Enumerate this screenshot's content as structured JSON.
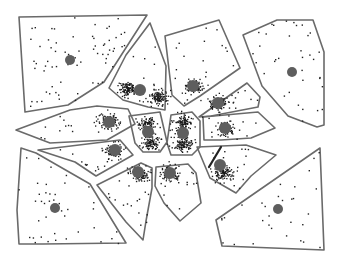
{
  "diagram": {
    "type": "voronoi-cells-with-point-clusters",
    "width": 341,
    "height": 262,
    "colors": {
      "cell_stroke": "#6a6a6a",
      "centroid": "#5e5e5e",
      "points": "#222222",
      "background": "#ffffff"
    },
    "cells": [
      {
        "id": "top-left",
        "points": [
          [
            19,
            17
          ],
          [
            147,
            15
          ],
          [
            104,
            82
          ],
          [
            68,
            105
          ],
          [
            25,
            112
          ]
        ],
        "centroid": [
          70,
          60
        ],
        "centroid_r": 5,
        "scatter": 70,
        "clusters": []
      },
      {
        "id": "top-center-left",
        "points": [
          [
            150,
            23
          ],
          [
            166,
            66
          ],
          [
            165,
            110
          ],
          [
            148,
            107
          ],
          [
            123,
            100
          ],
          [
            109,
            88
          ],
          [
            126,
            55
          ]
        ],
        "centroid": [
          140,
          90
        ],
        "centroid_r": 6,
        "scatter": 14,
        "clusters": [
          [
            127,
            88,
            8,
            110
          ],
          [
            158,
            97,
            8,
            110
          ]
        ]
      },
      {
        "id": "top-center-right",
        "points": [
          [
            165,
            36
          ],
          [
            219,
            20
          ],
          [
            240,
            68
          ],
          [
            200,
            96
          ],
          [
            184,
            106
          ],
          [
            172,
            95
          ]
        ],
        "centroid": [
          193,
          86
        ],
        "centroid_r": 6,
        "scatter": 18,
        "clusters": [
          [
            193,
            86,
            8,
            110
          ]
        ]
      },
      {
        "id": "top-right",
        "points": [
          [
            243,
            35
          ],
          [
            277,
            20
          ],
          [
            313,
            20
          ],
          [
            324,
            52
          ],
          [
            324,
            125
          ],
          [
            317,
            127
          ],
          [
            288,
            116
          ],
          [
            262,
            86
          ]
        ],
        "centroid": [
          292,
          72
        ],
        "centroid_r": 5,
        "scatter": 35,
        "clusters": []
      },
      {
        "id": "mid-right-upper",
        "points": [
          [
            199,
            117
          ],
          [
            247,
            83
          ],
          [
            260,
            97
          ],
          [
            258,
            107
          ],
          [
            211,
            116
          ]
        ],
        "centroid": [
          218,
          103
        ],
        "centroid_r": 6,
        "scatter": 14,
        "clusters": [
          [
            218,
            103,
            8,
            90
          ]
        ]
      },
      {
        "id": "mid-right",
        "points": [
          [
            203,
            117
          ],
          [
            258,
            112
          ],
          [
            275,
            128
          ],
          [
            251,
            138
          ],
          [
            221,
            140
          ],
          [
            204,
            140
          ]
        ],
        "centroid": [
          225,
          128
        ],
        "centroid_r": 6,
        "scatter": 10,
        "clusters": [
          [
            225,
            128,
            8,
            100
          ]
        ]
      },
      {
        "id": "left-upper",
        "points": [
          [
            16,
            130
          ],
          [
            70,
            110
          ],
          [
            97,
            106
          ],
          [
            128,
            109
          ],
          [
            135,
            124
          ],
          [
            107,
            140
          ],
          [
            50,
            143
          ]
        ],
        "centroid": [
          109,
          122
        ],
        "centroid_r": 6,
        "scatter": 14,
        "clusters": [
          [
            108,
            121,
            9,
            110
          ]
        ]
      },
      {
        "id": "center-left-core",
        "points": [
          [
            129,
            116
          ],
          [
            160,
            112
          ],
          [
            167,
            142
          ],
          [
            160,
            152
          ],
          [
            143,
            152
          ],
          [
            135,
            143
          ]
        ],
        "centroid": [
          148,
          132
        ],
        "centroid_r": 6,
        "scatter": 10,
        "clusters": [
          [
            146,
            123,
            7,
            80
          ],
          [
            151,
            142,
            8,
            100
          ]
        ]
      },
      {
        "id": "center-core",
        "points": [
          [
            171,
            115
          ],
          [
            192,
            112
          ],
          [
            200,
            121
          ],
          [
            200,
            147
          ],
          [
            192,
            155
          ],
          [
            171,
            155
          ],
          [
            167,
            143
          ]
        ],
        "centroid": [
          183,
          133
        ],
        "centroid_r": 6,
        "scatter": 16,
        "clusters": [
          [
            183,
            122,
            8,
            100
          ],
          [
            183,
            143,
            8,
            110
          ]
        ]
      },
      {
        "id": "left-lower",
        "points": [
          [
            38,
            150
          ],
          [
            120,
            140
          ],
          [
            133,
            155
          ],
          [
            96,
            176
          ],
          [
            75,
            162
          ]
        ],
        "centroid": [
          115,
          150
        ],
        "centroid_r": 6,
        "scatter": 12,
        "clusters": [
          [
            113,
            150,
            8,
            100
          ]
        ]
      },
      {
        "id": "right-lower-center",
        "points": [
          [
            197,
            147
          ],
          [
            246,
            145
          ],
          [
            276,
            155
          ],
          [
            251,
            176
          ],
          [
            236,
            193
          ],
          [
            210,
            178
          ]
        ],
        "centroid": [
          220,
          165
        ],
        "centroid_r": 6,
        "scatter": 18,
        "clusters": [
          [
            222,
            172,
            9,
            110
          ]
        ]
      },
      {
        "id": "bottom-left",
        "points": [
          [
            21,
            148
          ],
          [
            36,
            153
          ],
          [
            90,
            184
          ],
          [
            126,
            243
          ],
          [
            43,
            244
          ],
          [
            19,
            244
          ],
          [
            17,
            210
          ]
        ],
        "centroid": [
          55,
          208
        ],
        "centroid_r": 5,
        "scatter": 40,
        "clusters": []
      },
      {
        "id": "bottom-center-left",
        "points": [
          [
            97,
            185
          ],
          [
            141,
            163
          ],
          [
            152,
            168
          ],
          [
            152,
            188
          ],
          [
            146,
            221
          ],
          [
            143,
            240
          ],
          [
            126,
            222
          ]
        ],
        "centroid": [
          138,
          172
        ],
        "centroid_r": 6,
        "scatter": 18,
        "clusters": [
          [
            138,
            173,
            8,
            100
          ]
        ]
      },
      {
        "id": "bottom-center",
        "points": [
          [
            156,
            167
          ],
          [
            188,
            164
          ],
          [
            196,
            173
          ],
          [
            201,
            203
          ],
          [
            180,
            221
          ],
          [
            164,
            203
          ],
          [
            155,
            186
          ]
        ],
        "centroid": [
          170,
          173
        ],
        "centroid_r": 6,
        "scatter": 16,
        "clusters": [
          [
            170,
            173,
            8,
            100
          ]
        ]
      },
      {
        "id": "bottom-right",
        "points": [
          [
            216,
            220
          ],
          [
            320,
            148
          ],
          [
            324,
            250
          ],
          [
            222,
            246
          ]
        ],
        "centroid": [
          278,
          209
        ],
        "centroid_r": 5,
        "scatter": 30,
        "clusters": []
      }
    ],
    "arrow": {
      "from": [
        221,
        147
      ],
      "to": [
        209,
        167
      ]
    }
  }
}
